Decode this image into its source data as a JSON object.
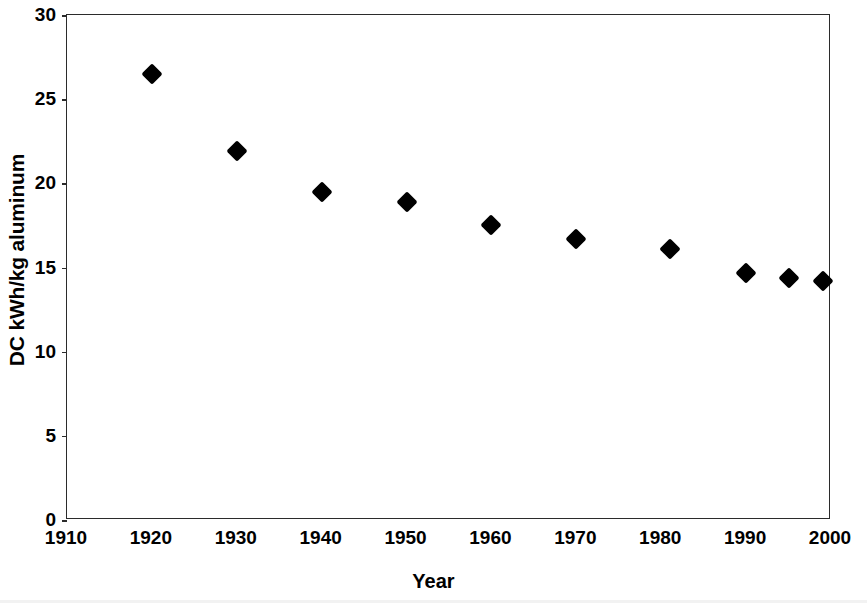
{
  "chart_data": {
    "type": "scatter",
    "title": "",
    "xlabel": "Year",
    "ylabel": "DC kWh/kg aluminum",
    "x": [
      1920,
      1930,
      1940,
      1950,
      1960,
      1970,
      1981,
      1990,
      1995,
      1999
    ],
    "values": [
      26.5,
      21.9,
      19.5,
      18.9,
      17.5,
      16.7,
      16.1,
      14.7,
      14.4,
      14.2
    ],
    "series": [
      {
        "name": "DC kWh/kg aluminum",
        "points": [
          {
            "x": 1920,
            "y": 26.5
          },
          {
            "x": 1930,
            "y": 21.9
          },
          {
            "x": 1940,
            "y": 19.5
          },
          {
            "x": 1950,
            "y": 18.9
          },
          {
            "x": 1960,
            "y": 17.5
          },
          {
            "x": 1970,
            "y": 16.7
          },
          {
            "x": 1981,
            "y": 16.1
          },
          {
            "x": 1990,
            "y": 14.7
          },
          {
            "x": 1995,
            "y": 14.4
          },
          {
            "x": 1999,
            "y": 14.2
          }
        ],
        "marker": "diamond",
        "color": "#000000"
      }
    ],
    "xlim": [
      1910,
      2000
    ],
    "ylim": [
      0,
      30
    ],
    "xticks": [
      1910,
      1920,
      1930,
      1940,
      1950,
      1960,
      1970,
      1980,
      1990,
      2000
    ],
    "yticks": [
      0,
      5,
      10,
      15,
      20,
      25,
      30
    ],
    "xtick_labels": [
      "1910",
      "1920",
      "1930",
      "1940",
      "1950",
      "1960",
      "1970",
      "1980",
      "1990",
      "2000"
    ],
    "ytick_labels": [
      "0",
      "5",
      "10",
      "15",
      "20",
      "25",
      "30"
    ],
    "grid": false,
    "legend": null,
    "legend_position": "none",
    "plot_border": true,
    "background_color": "#ffffff",
    "axis_color": "#2b2b2b"
  }
}
